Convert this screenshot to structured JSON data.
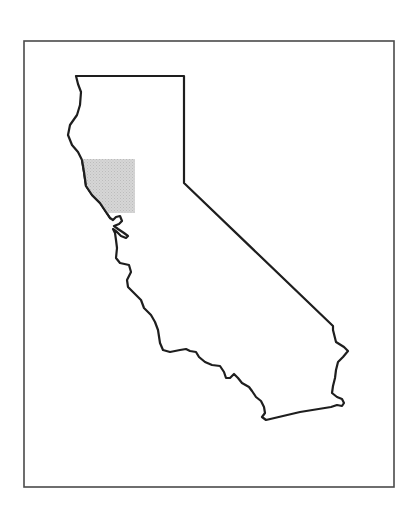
{
  "map": {
    "subject": "California state outline",
    "frame": {
      "x": 24,
      "y": 41,
      "width": 370,
      "height": 446
    },
    "colors": {
      "background": "#ffffff",
      "frame_stroke": "#4a4a4a",
      "outline_stroke": "#1e1e1e",
      "highlight_fill": "#d4d4d4",
      "highlight_dot": "#bdbdbd"
    },
    "highlighted_region": {
      "label": "North Bay / Sonoma-Napa area",
      "bounds": {
        "x": 84,
        "y": 159,
        "width": 51,
        "height": 54
      }
    }
  }
}
